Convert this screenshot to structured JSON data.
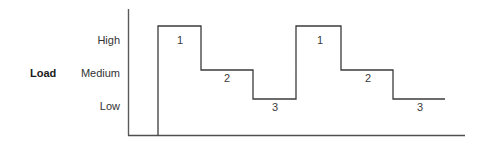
{
  "chart_data": {
    "type": "line",
    "title": "",
    "xlabel": "",
    "ylabel": "Load",
    "axis_label": "Load",
    "grid": false,
    "legend": "none",
    "y_categories": [
      "High",
      "Medium",
      "Low"
    ],
    "y_tick_labels": {
      "high": "High",
      "medium": "Medium",
      "low": "Low"
    },
    "step_style": "step-post",
    "series": [
      {
        "name": "Load profile",
        "points": [
          {
            "label": "1",
            "level": "High",
            "x_start": 158,
            "x_end": 201
          },
          {
            "label": "2",
            "level": "Medium",
            "x_start": 201,
            "x_end": 253
          },
          {
            "label": "3",
            "level": "Low",
            "x_start": 253,
            "x_end": 296
          },
          {
            "label": "1",
            "level": "High",
            "x_start": 296,
            "x_end": 341
          },
          {
            "label": "2",
            "level": "Medium",
            "x_start": 341,
            "x_end": 393
          },
          {
            "label": "3",
            "level": "Low",
            "x_start": 393,
            "x_end": 445
          }
        ]
      }
    ],
    "segment_labels": [
      "1",
      "2",
      "3",
      "1",
      "2",
      "3"
    ],
    "path": "M 158 135 L 158 26 L 201 26 L 201 70 L 253 70 L 253 99 L 296 99 L 296 26 L 341 26 L 341 70 L 393 70 L 393 99 L 445 99",
    "colors": {
      "line": "#3b3b3b",
      "axis": "#5a5a5a",
      "text": "#333333",
      "background": "#ffffff"
    }
  },
  "labels": {
    "load": "Load",
    "high": "High",
    "medium": "Medium",
    "low": "Low",
    "seg1": "1",
    "seg2": "2",
    "seg3": "3",
    "seg4": "1",
    "seg5": "2",
    "seg6": "3"
  }
}
